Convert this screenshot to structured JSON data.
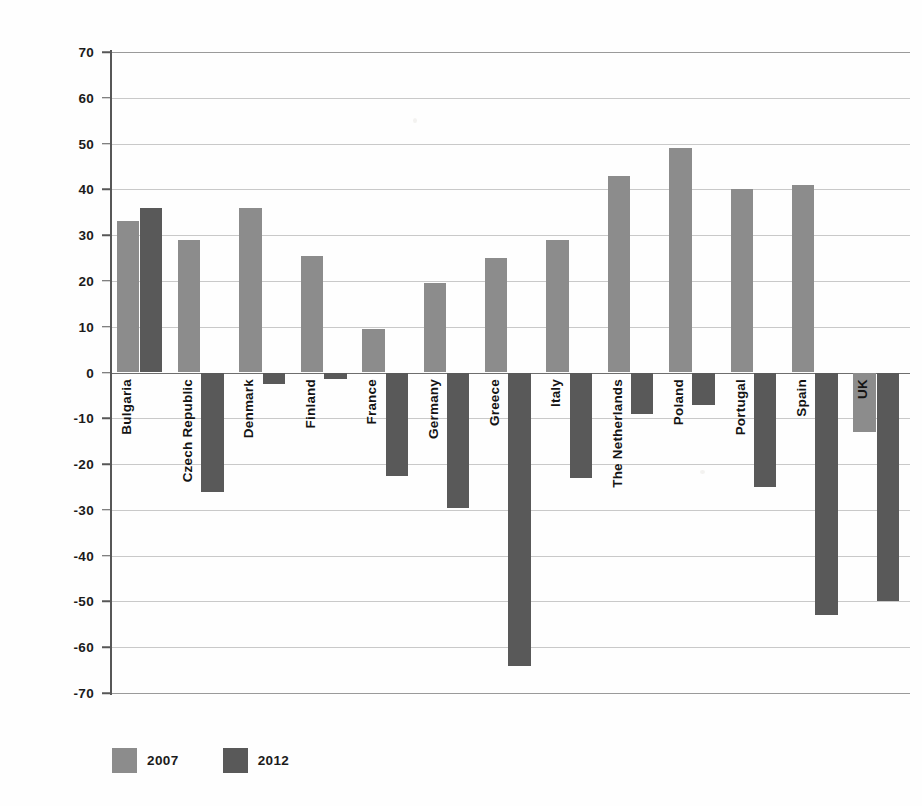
{
  "chart_data": {
    "type": "bar",
    "title": "",
    "subtitle": "",
    "xlabel": "",
    "ylabel": "",
    "ylim": [
      -70,
      70
    ],
    "ytick_step": 10,
    "yticks": [
      70,
      60,
      50,
      40,
      30,
      20,
      10,
      0,
      -10,
      -20,
      -30,
      -40,
      -50,
      -60,
      -70
    ],
    "ytick_labels": [
      "70",
      "60",
      "50",
      "40",
      "30",
      "20",
      "10",
      "0",
      "-10",
      "-20",
      "-30",
      "-40",
      "-50",
      "-60",
      "-70"
    ],
    "grid": true,
    "grid_axis": "y",
    "legend_position": "bottom-left",
    "categories": [
      "Bulgaria",
      "Czech Republic",
      "Denmark",
      "Finland",
      "France",
      "Germany",
      "Greece",
      "Italy",
      "The Netherlands",
      "Poland",
      "Portugal",
      "Spain",
      "UK"
    ],
    "series": [
      {
        "name": "2007",
        "color": "#8c8c8c",
        "values": [
          33,
          29,
          36,
          25.5,
          9.5,
          19.5,
          25,
          29,
          43,
          49,
          40,
          41,
          -13
        ]
      },
      {
        "name": "2012",
        "color": "#595959",
        "values": [
          36,
          -26,
          -2.5,
          -1.5,
          -22.5,
          -29.5,
          -64,
          -23,
          -9,
          -7,
          -25,
          -53,
          -50
        ]
      }
    ]
  },
  "legend": {
    "items": [
      {
        "label": "2007",
        "color": "#8c8c8c"
      },
      {
        "label": "2012",
        "color": "#595959"
      }
    ]
  },
  "colors": {
    "series_2007": "#8c8c8c",
    "series_2012": "#595959",
    "gridline": "#c9c9c9",
    "axis": "#575757",
    "zero_line": "#6e6e6e",
    "text": "#1b1b1b",
    "background": "#fefefe"
  }
}
